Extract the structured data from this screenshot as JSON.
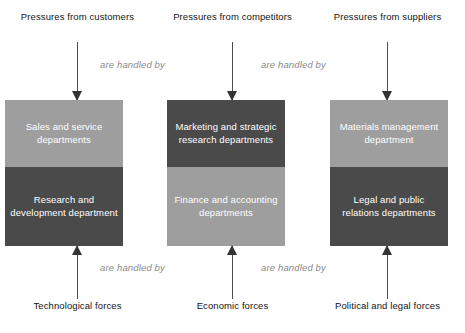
{
  "diagram": {
    "colors": {
      "light_cell": "#9e9e9e",
      "dark_cell": "#4a4a4a",
      "arrow": "#4d4d4d",
      "connector_label": "#8a8a8a",
      "background": "#ffffff",
      "label_text": "#141414",
      "cell_text": "#ffffff"
    },
    "connector_labels": {
      "top_left": "are handled by",
      "top_right": "are handled by",
      "bottom_left": "are handled by",
      "bottom_right": "are handled by"
    },
    "columns": [
      {
        "id": "customers",
        "top_force": "Pressures from customers",
        "bottom_force": "Technological forces",
        "upper_cell": {
          "label": "Sales and service departments",
          "shade": "light"
        },
        "lower_cell": {
          "label": "Research and development department",
          "shade": "dark"
        }
      },
      {
        "id": "competitors",
        "top_force": "Pressures from competitors",
        "bottom_force": "Economic forces",
        "upper_cell": {
          "label": "Marketing and strategic research departments",
          "shade": "dark"
        },
        "lower_cell": {
          "label": "Finance and accounting departments",
          "shade": "light"
        }
      },
      {
        "id": "suppliers",
        "top_force": "Pressures from suppliers",
        "bottom_force": "Political and legal forces",
        "upper_cell": {
          "label": "Materials management department",
          "shade": "light"
        },
        "lower_cell": {
          "label": "Legal and public relations departments",
          "shade": "dark"
        }
      }
    ]
  }
}
